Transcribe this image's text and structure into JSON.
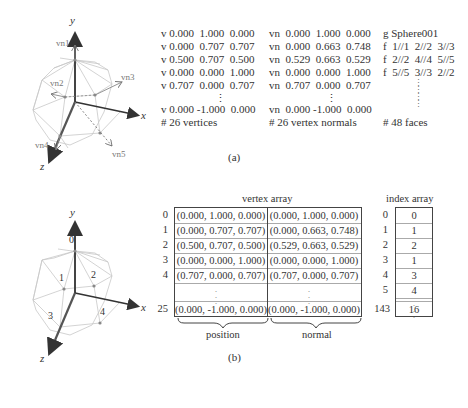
{
  "part_a": {
    "caption": "(a)",
    "diagram_labels": {
      "y_axis": "y",
      "x_axis": "x",
      "z_axis": "z",
      "normals": [
        "vn1",
        "vn2",
        "vn3",
        "vn4",
        "vn5"
      ]
    },
    "vertices": {
      "lines": [
        "v 0.000  1.000  0.000",
        "v 0.000  0.707  0.707",
        "v 0.500  0.707  0.500",
        "v 0.000  0.000  1.000",
        "v 0.707  0.000  0.707"
      ],
      "ellipsis": "⋮",
      "last_line": "v 0.000 -1.000  0.000",
      "comment": "# 26 vertices"
    },
    "normals": {
      "lines": [
        "vn  0.000  1.000  0.000",
        "vn  0.000  0.663  0.748",
        "vn  0.529  0.663  0.529",
        "vn  0.000  0.000  1.000",
        "vn  0.707  0.000  0.707"
      ],
      "ellipsis": "⋮",
      "last_line": "vn  0.000 -1.000  0.000",
      "comment": "# 26 vertex normals"
    },
    "faces": {
      "group": "g Sphere001",
      "lines": [
        "f  1//1  2//2  3//3",
        "f  2//2  4//4  5//5",
        "f  5//5  3//3  2//2"
      ],
      "ellipsis": "⋮",
      "comment": "# 48 faces"
    }
  },
  "part_b": {
    "caption": "(b)",
    "diagram_labels": {
      "y_axis": "y",
      "x_axis": "x",
      "z_axis": "z",
      "vertex_ids": [
        "0",
        "1",
        "2",
        "3",
        "4"
      ]
    },
    "vertex_array": {
      "title": "vertex array",
      "rows": [
        {
          "index": "0",
          "position": "(0.000, 1.000, 0.000)",
          "normal": "(0.000, 1.000, 0.000)"
        },
        {
          "index": "1",
          "position": "(0.000, 0.707, 0.707)",
          "normal": "(0.000, 0.663, 0.748)"
        },
        {
          "index": "2",
          "position": "(0.500, 0.707, 0.500)",
          "normal": "(0.529, 0.663, 0.529)"
        },
        {
          "index": "3",
          "position": "(0.000, 0.000, 1.000)",
          "normal": "(0.000, 0.000, 1.000)"
        },
        {
          "index": "4",
          "position": "(0.707, 0.000, 0.707)",
          "normal": "(0.707, 0.000, 0.707)"
        }
      ],
      "last_row": {
        "index": "25",
        "position": "(0.000, -1.000, 0.000)",
        "normal": "(0.000, -1.000, 0.000)"
      },
      "ellipsis": "⋮",
      "column_labels": {
        "position": "position",
        "normal": "normal"
      }
    },
    "index_array": {
      "title": "index array",
      "rows": [
        {
          "index": "0",
          "value": "0"
        },
        {
          "index": "1",
          "value": "1"
        },
        {
          "index": "2",
          "value": "2"
        },
        {
          "index": "3",
          "value": "1"
        },
        {
          "index": "4",
          "value": "3"
        },
        {
          "index": "5",
          "value": "4"
        }
      ],
      "last_row": {
        "index": "143",
        "value": "16"
      },
      "ellipsis": "⋮"
    }
  }
}
